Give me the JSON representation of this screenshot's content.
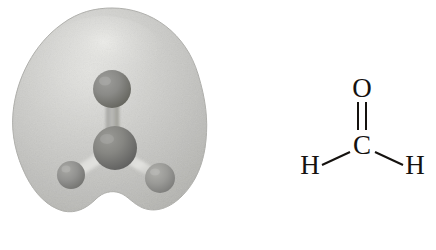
{
  "figure": {
    "background_color": "#ffffff",
    "width": 436,
    "height": 250
  },
  "model": {
    "caption": "space-filling electron density model of formaldehyde",
    "cloud": {
      "name": "electron-density-cloud",
      "fill_color": "#c3c3c0",
      "edge_color": "#b2b2ae",
      "highlight_color": "#e4e4e1"
    },
    "atoms": [
      {
        "id": "oxygen",
        "element": "O",
        "label": "O",
        "color": "#8b8b88",
        "shade_color": "#6f6f6c",
        "cx": 112,
        "cy": 89,
        "r": 19
      },
      {
        "id": "carbon",
        "element": "C",
        "label": "C",
        "color": "#8a8a86",
        "shade_color": "#6c6c69",
        "cx": 115,
        "cy": 148,
        "r": 22
      },
      {
        "id": "hydrogen-left",
        "element": "H",
        "label": "H",
        "color": "#979793",
        "shade_color": "#7c7c78",
        "cx": 71,
        "cy": 175,
        "r": 14
      },
      {
        "id": "hydrogen-right",
        "element": "H",
        "label": "H",
        "color": "#9c9c98",
        "shade_color": "#818180",
        "cx": 160,
        "cy": 178,
        "r": 15
      }
    ],
    "bonds": [
      {
        "id": "bond-o-c",
        "from": "oxygen",
        "to": "carbon",
        "color": "#a9a9a6"
      },
      {
        "id": "bond-c-h-left",
        "from": "carbon",
        "to": "hydrogen-left",
        "color": "#d3d3d0"
      },
      {
        "id": "bond-c-h-right",
        "from": "carbon",
        "to": "hydrogen-right",
        "color": "#c6c6c3"
      }
    ]
  },
  "formula": {
    "caption": "structural formula of formaldehyde",
    "molecule": "formaldehyde",
    "formula_text": "H2C=O",
    "bond_color": "#15120f",
    "label_color": "#15120f",
    "atoms": [
      {
        "id": "formula-atom-o",
        "label": "O",
        "x": 144,
        "y": 92
      },
      {
        "id": "formula-atom-c",
        "label": "C",
        "x": 144,
        "y": 150
      },
      {
        "id": "formula-atom-h-left",
        "label": "H",
        "x": 95,
        "y": 167
      },
      {
        "id": "formula-atom-h-right",
        "label": "H",
        "x": 194,
        "y": 167
      }
    ],
    "bonds": [
      {
        "id": "formula-double-bond-c-o",
        "type": "double",
        "from": "C",
        "to": "O"
      },
      {
        "id": "formula-single-bond-c-h-left",
        "type": "single",
        "from": "C",
        "to": "H"
      },
      {
        "id": "formula-single-bond-c-h-right",
        "type": "single",
        "from": "C",
        "to": "H"
      }
    ]
  }
}
